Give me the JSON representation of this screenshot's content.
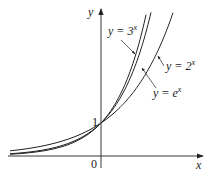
{
  "figure": {
    "axis_x_label": "x",
    "axis_y_label": "y",
    "origin_label": "0",
    "intercept_label": "1",
    "curves": [
      {
        "name": "3^x",
        "label_prefix": "y = 3",
        "exponent": "x",
        "base": 3
      },
      {
        "name": "e^x",
        "label_prefix": "y = e",
        "exponent": "x",
        "base": 2.718281828
      },
      {
        "name": "2^x",
        "label_prefix": "y = 2",
        "exponent": "x",
        "base": 2
      }
    ]
  },
  "chart_data": {
    "type": "line",
    "title": "",
    "xlabel": "x",
    "ylabel": "y",
    "xlim": [
      -2.6,
      2.9
    ],
    "ylim": [
      -0.6,
      4.3
    ],
    "grid": false,
    "series": [
      {
        "name": "y = 3^x",
        "x": [
          -2.6,
          -2,
          -1,
          0,
          0.5,
          1,
          1.32
        ],
        "values": [
          0.057,
          0.111,
          0.333,
          1,
          1.732,
          3,
          4.27
        ]
      },
      {
        "name": "y = e^x",
        "x": [
          -2.6,
          -2,
          -1,
          0,
          0.5,
          1,
          1.45
        ],
        "values": [
          0.074,
          0.135,
          0.368,
          1,
          1.649,
          2.718,
          4.26
        ]
      },
      {
        "name": "y = 2^x",
        "x": [
          -2.6,
          -2,
          -1,
          0,
          1,
          1.5,
          2.09
        ],
        "values": [
          0.165,
          0.25,
          0.5,
          1,
          2,
          2.828,
          4.26
        ]
      }
    ],
    "annotations": [
      "y = 3^x",
      "y = e^x",
      "y = 2^x",
      "1",
      "0"
    ]
  }
}
